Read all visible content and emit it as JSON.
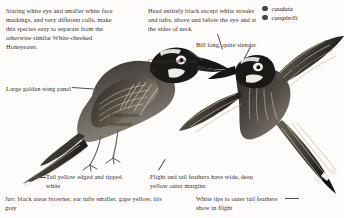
{
  "plate": {
    "title": "New Holland Honeyeater identification plate",
    "background_color": "#fdfcfa",
    "ink_color": "#2a2724"
  },
  "legend": {
    "items": [
      {
        "label": "caudata",
        "marker_color": "#4a4641",
        "marker": "filled-circle"
      },
      {
        "label": "campbelli",
        "marker_color": "#4a4641",
        "marker": "filled-circle"
      }
    ]
  },
  "notes": {
    "intro": "Staring white eye and smaller white face markings, and very different calls, make this species easy to separate from the otherwise similar White-cheeked Honeyeater.",
    "head": "Head entirely black except white streaks and tufts, above and below the eye and at the sides of neck",
    "bill": "Bill long, quite slender",
    "iris": "Conspicuous white iris",
    "wing_panel": "Large golden wing panel",
    "underparts": "Underparts streaked",
    "tail": "Tail yellow edged and tipped white",
    "juvenile": "Juv: black areas browner, ear tufts smaller, gape yellow, iris grey",
    "flight_feathers": "Flight and tail feathers have wide, deep yellow outer margins",
    "white_tips": "White tips to outer tail feathers show in flight"
  },
  "figures": {
    "perched": {
      "name": "perched-honeyeater",
      "pose": "perched, side profile facing right"
    },
    "flying": {
      "name": "flying-honeyeater",
      "pose": "in flight, wings spread, facing left"
    }
  }
}
